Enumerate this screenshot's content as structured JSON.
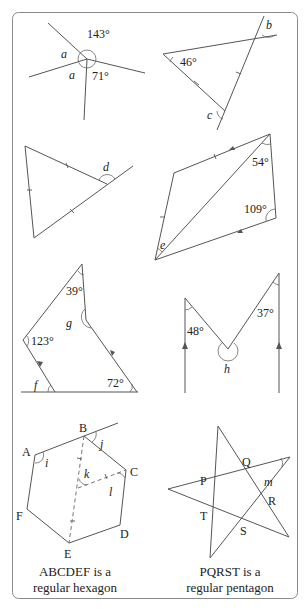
{
  "frame": {
    "border_color": "#8a8a8a",
    "line_color": "#555555"
  },
  "diagrams": [
    {
      "id": "angles-at-point",
      "labels": {
        "angle1": "143°",
        "var_a1": "a",
        "var_a2": "a",
        "angle2": "71°"
      }
    },
    {
      "id": "isosceles-triangle-b-c",
      "labels": {
        "angle1": "46°",
        "var_b": "b",
        "var_c": "c"
      }
    },
    {
      "id": "equilateral-triangle-d",
      "labels": {
        "var_d": "d"
      }
    },
    {
      "id": "quadrilateral-e",
      "labels": {
        "angle1": "54°",
        "angle2": "109°",
        "var_e": "e"
      }
    },
    {
      "id": "pentagon-f-g",
      "labels": {
        "angle1": "39°",
        "angle2": "123°",
        "angle3": "72°",
        "var_f": "f",
        "var_g": "g"
      }
    },
    {
      "id": "parallel-lines-h",
      "labels": {
        "angle1": "48°",
        "angle2": "37°",
        "var_h": "h"
      }
    },
    {
      "id": "regular-hexagon",
      "vertices": {
        "A": "A",
        "B": "B",
        "C": "C",
        "D": "D",
        "E": "E",
        "F": "F"
      },
      "labels": {
        "var_i": "i",
        "var_j": "j",
        "var_k": "k",
        "var_l": "l"
      },
      "caption": {
        "line1": "ABCDEF is a",
        "line2": "regular hexagon"
      }
    },
    {
      "id": "regular-pentagon-star",
      "vertices": {
        "P": "P",
        "Q": "Q",
        "R": "R",
        "S": "S",
        "T": "T"
      },
      "labels": {
        "var_m": "m"
      },
      "caption": {
        "line1": "PQRST is a",
        "line2": "regular pentagon"
      }
    }
  ]
}
